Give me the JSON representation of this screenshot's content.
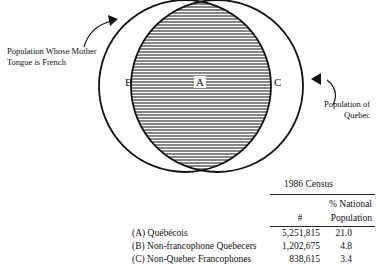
{
  "diagram": {
    "type": "venn",
    "circles": [
      {
        "id": "french",
        "label": "Population Whose Mother Tongue is French"
      },
      {
        "id": "quebec",
        "label": "Population of Quebec"
      }
    ],
    "regions": {
      "A": "A",
      "B": "B",
      "C": "C"
    },
    "callouts": {
      "left_line1": "Population Whose Mother",
      "left_line2": "Tongue is French",
      "right_line1": "Population of",
      "right_line2": "Quebec"
    },
    "colors": {
      "stroke": "#111111",
      "hatch": "#222222",
      "background": "#ffffff"
    }
  },
  "table": {
    "title": "1986 Census",
    "headers": {
      "count": "#",
      "pct_line1": "% National",
      "pct_line2": "Population"
    },
    "rows": [
      {
        "label": "(A)  Québécois",
        "count": "5,251,815",
        "pct": "21.0"
      },
      {
        "label": "(B)  Non-francophone Quebecers",
        "count": "1,202,675",
        "pct": "4.8"
      },
      {
        "label": "(C)  Non-Quebec Francophones",
        "count": "838,615",
        "pct": "3.4"
      }
    ]
  }
}
